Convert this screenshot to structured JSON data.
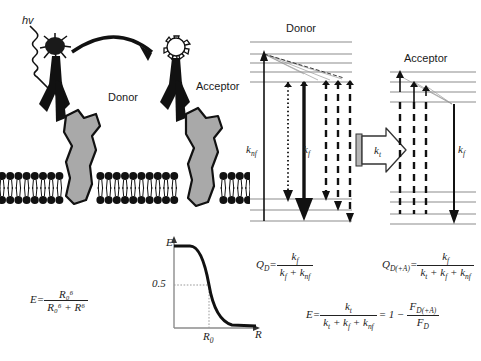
{
  "figure": {
    "panels": {
      "membrane": {
        "photon_label": "hv",
        "donor_label": "Donor",
        "acceptor_label": "Acceptor",
        "donor_star": "filled-star",
        "acceptor_star": "open-star",
        "transfer_arrow": "curved-arrow-donor-to-acceptor"
      },
      "efficiency_plot": {
        "y_axis_label": "E",
        "x_axis_label": "R",
        "y_tick_label": "0.5",
        "x_tick_label": "R",
        "x_tick_sub": "0",
        "curve": "sigmoid-decay"
      },
      "jablonski": {
        "donor_title": "Donor",
        "acceptor_title": "Acceptor",
        "k_nf_label": "k",
        "k_nf_sub": "nf",
        "k_f_label": "k",
        "k_f_sub": "f",
        "k_t_label": "k",
        "k_t_sub": "t",
        "k_f_acceptor_label": "k",
        "k_f_acceptor_sub": "f"
      }
    },
    "equations": {
      "forster": {
        "lhs": "E",
        "eq": "=",
        "num": "R₀⁶",
        "den": "R₀⁶ + R⁶"
      },
      "qd": {
        "lhs": "Q",
        "lhs_sub": "D",
        "eq": "=",
        "num": "k",
        "num_sub": "f",
        "den": "k_f + k_nf"
      },
      "qda": {
        "lhs": "Q",
        "lhs_sub": "D(+A)",
        "eq": "=",
        "num": "k",
        "num_sub": "f",
        "den": "k_t + k_f + k_nf"
      },
      "efficiency": {
        "lhs": "E",
        "eq": "=",
        "num": "k",
        "num_sub": "t",
        "den": "k_t + k_f + k_nf",
        "eq2": "= 1 −",
        "num2": "F",
        "num2_sub": "D(+A)",
        "den2": "F",
        "den2_sub": "D"
      }
    },
    "colors": {
      "ink": "#111111",
      "receptor_gray": "#a9a9a9",
      "level_gray": "#8c8c8c",
      "background": "#ffffff"
    }
  }
}
